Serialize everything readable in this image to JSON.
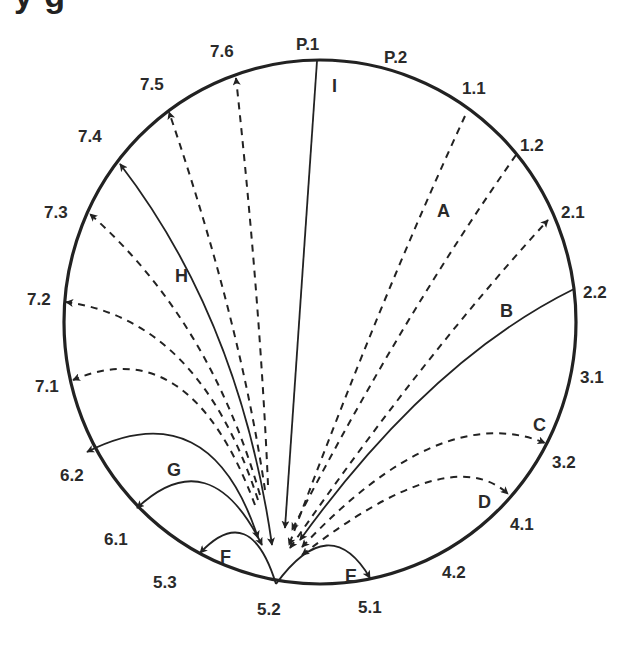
{
  "title_fragment": "y           g",
  "diagram": {
    "type": "circular flow diagram",
    "hub_node": "5.2",
    "colors": {
      "line": "#222222",
      "text": "#2a2a2a",
      "background": "#ffffff"
    },
    "nodes": [
      {
        "id": "P.1",
        "label": "P.1"
      },
      {
        "id": "P.2",
        "label": "P.2"
      },
      {
        "id": "1.1",
        "label": "1.1"
      },
      {
        "id": "1.2",
        "label": "1.2"
      },
      {
        "id": "2.1",
        "label": "2.1"
      },
      {
        "id": "2.2",
        "label": "2.2"
      },
      {
        "id": "3.1",
        "label": "3.1"
      },
      {
        "id": "3.2",
        "label": "3.2"
      },
      {
        "id": "4.1",
        "label": "4.1"
      },
      {
        "id": "4.2",
        "label": "4.2"
      },
      {
        "id": "5.1",
        "label": "5.1"
      },
      {
        "id": "5.2",
        "label": "5.2"
      },
      {
        "id": "5.3",
        "label": "5.3"
      },
      {
        "id": "6.1",
        "label": "6.1"
      },
      {
        "id": "6.2",
        "label": "6.2"
      },
      {
        "id": "7.1",
        "label": "7.1"
      },
      {
        "id": "7.2",
        "label": "7.2"
      },
      {
        "id": "7.3",
        "label": "7.3"
      },
      {
        "id": "7.4",
        "label": "7.4"
      },
      {
        "id": "7.5",
        "label": "7.5"
      },
      {
        "id": "7.6",
        "label": "7.6"
      }
    ],
    "path_labels": [
      "A",
      "B",
      "C",
      "D",
      "E",
      "F",
      "G",
      "H",
      "I"
    ],
    "edges": [
      {
        "group": "I",
        "from": "P.1",
        "to": "5.2",
        "style": "solid",
        "arrow": "to-hub"
      },
      {
        "group": "A",
        "from": "1.1",
        "to": "5.2",
        "style": "dashed",
        "arrow": "to-hub"
      },
      {
        "group": "A",
        "from": "1.2",
        "to": "5.2",
        "style": "dashed",
        "arrow": "to-hub"
      },
      {
        "group": "A",
        "from": "5.2",
        "to": "2.1",
        "style": "dashed",
        "arrow": "both"
      },
      {
        "group": "B",
        "from": "2.2",
        "to": "5.2",
        "style": "solid",
        "arrow": "to-hub"
      },
      {
        "group": "C",
        "from": "5.2",
        "to": "3.2",
        "style": "dashed",
        "arrow": "both"
      },
      {
        "group": "D",
        "from": "5.2",
        "to": "4.1",
        "style": "dashed",
        "arrow": "both"
      },
      {
        "group": "E",
        "from": "5.2",
        "to": "5.1",
        "style": "solid",
        "arrow": "to-rim"
      },
      {
        "group": "F",
        "from": "5.2",
        "to": "5.3",
        "style": "solid",
        "arrow": "to-rim"
      },
      {
        "group": "G",
        "from": "5.2",
        "to": "6.1",
        "style": "solid",
        "arrow": "both"
      },
      {
        "group": "G",
        "from": "5.2",
        "to": "6.2",
        "style": "solid",
        "arrow": "both"
      },
      {
        "group": "H",
        "from": "5.2",
        "to": "7.1",
        "style": "dashed",
        "arrow": "to-rim"
      },
      {
        "group": "H",
        "from": "5.2",
        "to": "7.2",
        "style": "dashed",
        "arrow": "to-rim"
      },
      {
        "group": "H",
        "from": "5.2",
        "to": "7.3",
        "style": "dashed",
        "arrow": "to-rim"
      },
      {
        "group": "H",
        "from": "5.2",
        "to": "7.4",
        "style": "solid",
        "arrow": "both"
      },
      {
        "group": "H",
        "from": "5.2",
        "to": "7.5",
        "style": "dashed",
        "arrow": "to-rim"
      },
      {
        "group": "H",
        "from": "5.2",
        "to": "7.6",
        "style": "dashed",
        "arrow": "to-rim"
      }
    ]
  }
}
